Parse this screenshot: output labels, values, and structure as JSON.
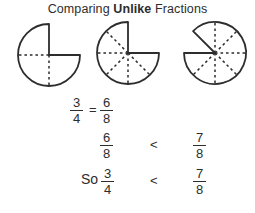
{
  "title": {
    "prefix": "Comparing",
    "emphasis": "Unlike",
    "suffix": "Fractions"
  },
  "colors": {
    "background": "#ffffff",
    "ink": "#2d2d2d"
  },
  "circles": [
    {
      "name": "three-fourths-circle",
      "fraction_shown": "3/4",
      "total_divisions": 4,
      "shaded_divisions": 3,
      "cx": 49,
      "cy": 55,
      "r": 31,
      "missing_start_deg": 0,
      "missing_end_deg": 90,
      "divider_angles_deg": [
        180,
        270
      ]
    },
    {
      "name": "six-eighths-circle",
      "fraction_shown": "6/8",
      "total_divisions": 8,
      "shaded_divisions": 6,
      "cx": 128,
      "cy": 53,
      "r": 31,
      "missing_start_deg": 0,
      "missing_end_deg": 90,
      "divider_angles_deg": [
        135,
        180,
        225,
        270,
        315
      ]
    },
    {
      "name": "seven-eighths-circle",
      "fraction_shown": "7/8",
      "total_divisions": 8,
      "shaded_divisions": 7,
      "cx": 215,
      "cy": 53,
      "r": 31,
      "missing_start_deg": 270,
      "missing_end_deg": 315,
      "divider_angles_deg": [
        0,
        45,
        90,
        135,
        180,
        225
      ]
    }
  ],
  "equations": [
    {
      "left": {
        "num": "3",
        "den": "4"
      },
      "operator": "=",
      "right": {
        "num": "6",
        "den": "8"
      }
    },
    {
      "left": {
        "num": "6",
        "den": "8"
      },
      "operator": "<",
      "right": {
        "num": "7",
        "den": "8"
      }
    },
    {
      "prefix": "So",
      "left": {
        "num": "3",
        "den": "4"
      },
      "operator": "<",
      "right": {
        "num": "7",
        "den": "8"
      }
    }
  ]
}
